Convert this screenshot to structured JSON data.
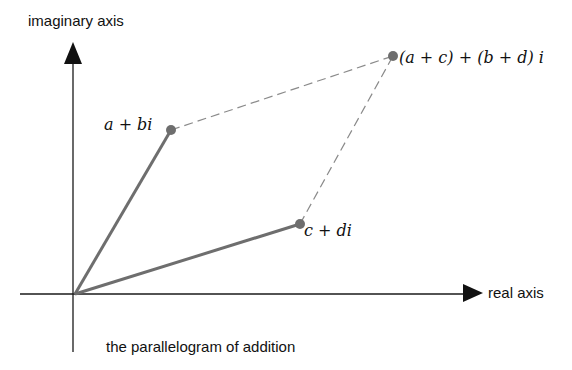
{
  "diagram": {
    "caption": "the parallelogram of addition",
    "axes": {
      "vertical_label": "imaginary axis",
      "horizontal_label": "real axis"
    },
    "points": [
      {
        "id": "z1",
        "label": "a + bi",
        "x": 171,
        "y": 130
      },
      {
        "id": "z2",
        "label": "c + di",
        "x": 300,
        "y": 224
      },
      {
        "id": "sum",
        "label": "(a + c) + (b + d) i",
        "x": 393,
        "y": 56
      }
    ],
    "origin": {
      "x": 74,
      "y": 294
    },
    "colors": {
      "vector": "#6e6e6e",
      "dashed": "#8a8a8a",
      "axis": "#1a1a1a",
      "point": "#6e6e6e"
    }
  }
}
